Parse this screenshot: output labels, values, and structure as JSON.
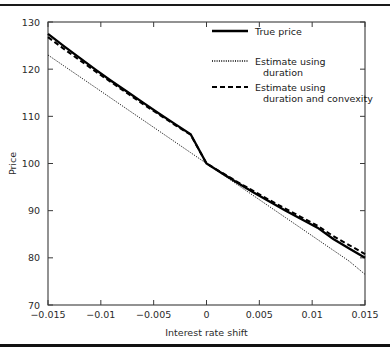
{
  "chart_data": {
    "type": "line",
    "title": "",
    "xlabel": "Interest rate shift",
    "ylabel": "Price",
    "xlim": [
      -0.015,
      0.015
    ],
    "ylim": [
      70,
      130
    ],
    "grid": false,
    "legend_position": "top-right",
    "xticks": [
      -0.015,
      -0.01,
      -0.005,
      0,
      0.005,
      0.01,
      0.015
    ],
    "xticklabels": [
      "-0.015",
      "-0.01",
      "-0.005",
      "0",
      "0.005",
      "0.01",
      "0.015"
    ],
    "yticks": [
      70,
      80,
      90,
      100,
      110,
      120,
      130
    ],
    "yticklabels": [
      "70",
      "80",
      "90",
      "100",
      "110",
      "120",
      "130"
    ],
    "x": [
      -0.015,
      -0.0135,
      -0.012,
      -0.0105,
      -0.009,
      -0.0075,
      -0.006,
      -0.0045,
      -0.003,
      -0.0015,
      0,
      0.0015,
      0.003,
      0.0045,
      0.006,
      0.0075,
      0.009,
      0.0105,
      0.012,
      0.0135,
      0.015
    ],
    "series": [
      {
        "name": "True price",
        "style": "solid",
        "values": [
          127.5,
          124.9,
          122.4,
          119.9,
          117.5,
          115.2,
          112.9,
          110.6,
          108.4,
          106.2,
          100.0,
          97.9,
          95.8,
          93.8,
          91.9,
          90.0,
          88.2,
          86.4,
          84.0,
          82.0,
          80.0
        ]
      },
      {
        "name": "Estimate using duration",
        "style": "dotted",
        "values": [
          123.0,
          120.7,
          118.4,
          116.1,
          113.8,
          111.5,
          109.2,
          106.9,
          104.6,
          102.3,
          100.0,
          97.7,
          95.4,
          93.1,
          90.8,
          88.5,
          86.2,
          83.9,
          81.6,
          79.3,
          76.5
        ]
      },
      {
        "name": "Estimate using duration and convexity",
        "style": "dashed",
        "values": [
          126.8,
          124.3,
          121.9,
          119.5,
          117.2,
          114.9,
          112.6,
          110.4,
          108.2,
          106.1,
          100.0,
          98.0,
          96.0,
          94.1,
          92.2,
          90.4,
          88.6,
          86.8,
          84.6,
          82.7,
          80.8
        ]
      }
    ]
  },
  "legend": {
    "entries": [
      {
        "label": "True price",
        "label_line2": ""
      },
      {
        "label": "Estimate using",
        "label_line2": "duration"
      },
      {
        "label": "Estimate using",
        "label_line2": "duration and convexity"
      }
    ]
  }
}
